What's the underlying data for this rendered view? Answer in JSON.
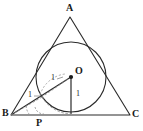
{
  "figure": {
    "kind": "geometry-diagram",
    "width": 143,
    "height": 131,
    "background_color": "#ffffff",
    "stroke_color": "#2a2a2a",
    "dash_color": "#8a8a8a",
    "vertices": [
      {
        "name": "A",
        "label": "A",
        "label_x": 66,
        "label_y": 3,
        "x": 70,
        "y": 17
      },
      {
        "name": "B",
        "label": "B",
        "label_x": 2,
        "label_y": 109,
        "x": 11,
        "y": 115
      },
      {
        "name": "C",
        "label": "C",
        "label_x": 132,
        "label_y": 110,
        "x": 130,
        "y": 115
      }
    ],
    "points": [
      {
        "name": "O",
        "label": "O",
        "label_x": 75,
        "label_y": 68,
        "x": 71,
        "y": 77,
        "dot": true
      },
      {
        "name": "P",
        "label": "P",
        "label_x": 36,
        "label_y": 118,
        "x": 40,
        "y": 115,
        "dot": false
      }
    ],
    "circle": {
      "cx": 71,
      "cy": 77,
      "r": 35
    },
    "measure_labels": [
      {
        "id": "radius-to-tangent-left",
        "text": "1",
        "x": 51,
        "y": 75
      },
      {
        "id": "radius-upper-left",
        "text": "1",
        "x": 28,
        "y": 92
      },
      {
        "id": "radius-vertical",
        "text": "1",
        "x": 76,
        "y": 91
      }
    ]
  }
}
